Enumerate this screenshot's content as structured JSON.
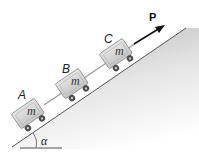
{
  "diagram": {
    "force_label": "P",
    "angle_label": "α",
    "carts": [
      {
        "id": "A",
        "label": "A",
        "mass_label": "m"
      },
      {
        "id": "B",
        "label": "B",
        "mass_label": "m"
      },
      {
        "id": "C",
        "label": "C",
        "mass_label": "m"
      }
    ],
    "colors": {
      "incline_line": "#555555",
      "incline_fill_top": "#bdbdbd",
      "cart_body": "#d9d9d9",
      "cart_stroke": "#8a8a8a",
      "wheel": "#4a4a4a",
      "cable": "#9a9a9a",
      "arrow": "#111111"
    }
  }
}
